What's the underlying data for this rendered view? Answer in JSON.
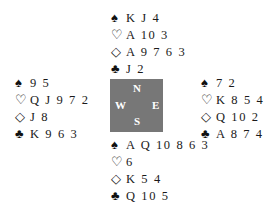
{
  "deal": {
    "north": {
      "spades": "K J 4",
      "hearts": "A 10 3",
      "diamonds": "A 9 7 6 3",
      "clubs": "J 2"
    },
    "west": {
      "spades": "9 5",
      "hearts": "Q J 9 7 2",
      "diamonds": "J 8",
      "clubs": "K 9 6 3"
    },
    "east": {
      "spades": "7 2",
      "hearts": "K 8 5 4",
      "diamonds": "Q 10 2",
      "clubs": "A 8 7 4"
    },
    "south": {
      "spades": "A Q 10 8 6 3",
      "hearts": "6",
      "diamonds": "K 5 4",
      "clubs": "Q 10 5"
    }
  },
  "suit_symbols": {
    "spades": "♠",
    "hearts": "♡",
    "diamonds": "◇",
    "clubs": "♣"
  },
  "compass": {
    "north": "N",
    "south": "S",
    "east": "E",
    "west": "W",
    "background": "#777777"
  }
}
